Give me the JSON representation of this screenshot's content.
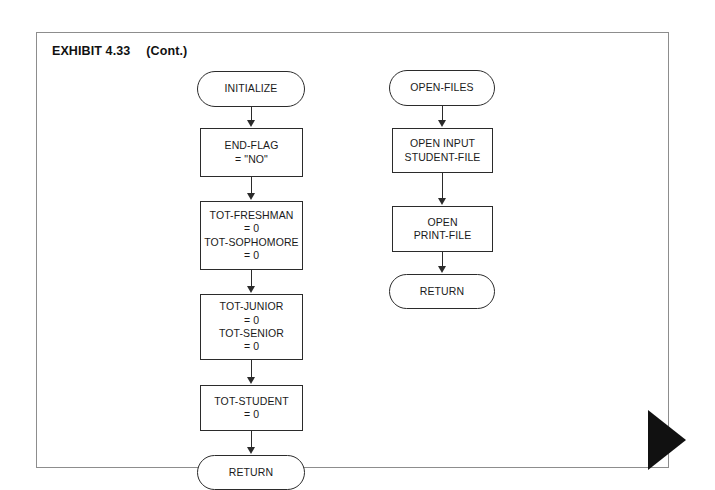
{
  "page": {
    "exhibit_label": "EXHIBIT 4.33",
    "continued_label": "(Cont.)",
    "border_color": "#8d8d8d",
    "background": "#ffffff",
    "marker_color": "#111111",
    "node_stroke": "#2b2b2b"
  },
  "diagram": {
    "type": "flowchart",
    "columns": [
      {
        "name": "initialize-routine",
        "nodes": [
          {
            "id": "initialize",
            "shape": "terminator",
            "lines": [
              "INITIALIZE"
            ]
          },
          {
            "id": "end-flag",
            "shape": "process",
            "lines": [
              "END-FLAG",
              "= \"NO\""
            ]
          },
          {
            "id": "tot-freshman-sophomore",
            "shape": "process",
            "lines": [
              "TOT-FRESHMAN",
              "= 0",
              "TOT-SOPHOMORE",
              "= 0"
            ]
          },
          {
            "id": "tot-junior-senior",
            "shape": "process",
            "lines": [
              "TOT-JUNIOR",
              "= 0",
              "TOT-SENIOR",
              "= 0"
            ]
          },
          {
            "id": "tot-student",
            "shape": "process",
            "lines": [
              "TOT-STUDENT",
              "= 0"
            ]
          },
          {
            "id": "return-initialize",
            "shape": "terminator",
            "lines": [
              "RETURN"
            ]
          }
        ]
      },
      {
        "name": "open-files-routine",
        "nodes": [
          {
            "id": "open-files",
            "shape": "terminator",
            "lines": [
              "OPEN-FILES"
            ]
          },
          {
            "id": "open-input-student-file",
            "shape": "process",
            "lines": [
              "OPEN INPUT",
              "STUDENT-FILE"
            ]
          },
          {
            "id": "open-print-file",
            "shape": "process",
            "lines": [
              "OPEN",
              "PRINT-FILE"
            ]
          },
          {
            "id": "return-open-files",
            "shape": "terminator",
            "lines": [
              "RETURN"
            ]
          }
        ]
      }
    ]
  }
}
